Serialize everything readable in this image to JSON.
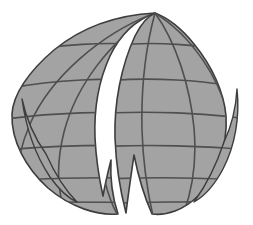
{
  "artboard": {
    "width": 253,
    "height": 225,
    "background_color": "#ffffff",
    "title": "Globe Logo"
  },
  "logo": {
    "name": "segmented-globe",
    "alt_text": "Stylized gray globe with latitude and longitude grid, split into segments",
    "fill_color": "#a3a3a3",
    "grid_line_color": "#4f4f4f",
    "outline_color": "#3d3d3d",
    "gap_color": "#ffffff",
    "fill_opacity": "1",
    "grid_line_width": "1.6",
    "outline_width": "1.6"
  },
  "geometry": {
    "center_x": 127,
    "center_y": 113,
    "radius_x": 115,
    "radius_y": 100,
    "north_pole": {
      "x": 155,
      "y": 13
    },
    "south_pole": {
      "x": 143,
      "y": 213
    },
    "bounds": {
      "left": 12,
      "right": 242,
      "top": 13,
      "bottom": 214
    }
  },
  "chart_data": {
    "type": "scatter",
    "xlabel": "",
    "ylabel": "",
    "latitude_lines_y": [
      53,
      88,
      118,
      148,
      178,
      200
    ],
    "longitude_count": 6,
    "segments": [
      {
        "label": "left-main-lobe",
        "name": "left-hemisphere-body"
      },
      {
        "label": "right-main-lobe",
        "name": "right-hemisphere-body"
      },
      {
        "label": "left-outer-sliver",
        "name": "left-crescent-sliver"
      },
      {
        "label": "right-outer-sliver",
        "name": "right-crescent-sliver"
      }
    ],
    "gaps": [
      {
        "label": "top-center-wedge",
        "name": "upper-split-gap"
      },
      {
        "label": "bottom-center-wedge",
        "name": "lower-split-gap"
      },
      {
        "label": "left-edge-slit",
        "name": "left-split-gap"
      },
      {
        "label": "right-edge-slit",
        "name": "right-split-gap"
      }
    ]
  }
}
